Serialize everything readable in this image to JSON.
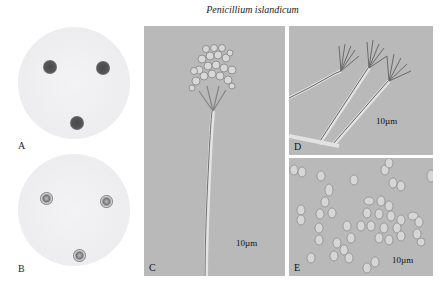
{
  "figure": {
    "title": "Penicillium islandicum",
    "panels": [
      {
        "id": "A",
        "label": "A",
        "type": "culture-plate",
        "colonies": 3,
        "colony_color": "#4a4a4a"
      },
      {
        "id": "B",
        "label": "B",
        "type": "culture-plate",
        "colonies": 3,
        "colony_color": "#7a7a7a"
      },
      {
        "id": "C",
        "label": "C",
        "type": "micrograph",
        "subject": "conidiophore",
        "scale_bar": "10µm"
      },
      {
        "id": "D",
        "label": "D",
        "type": "micrograph",
        "subject": "penicilli",
        "scale_bar": "10µm"
      },
      {
        "id": "E",
        "label": "E",
        "type": "micrograph",
        "subject": "conidia",
        "scale_bar": "10µm"
      }
    ]
  },
  "colors": {
    "micrograph_bg": "#b9b9b9",
    "plate_bg": "#ededf0"
  }
}
